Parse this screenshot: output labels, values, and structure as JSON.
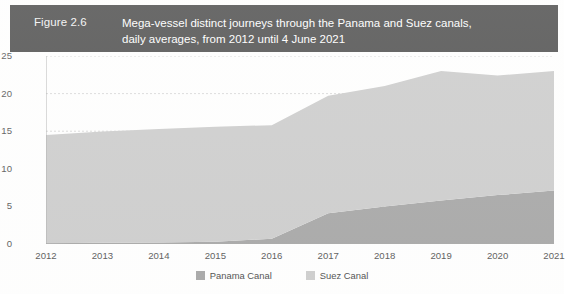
{
  "figure": {
    "number_label": "Figure 2.6",
    "title_line1": "Mega-vessel distinct journeys through the Panama and Suez canals,",
    "title_line2": "daily averages, from 2012 until 4 June 2021",
    "header_bg": "#3a3a3a",
    "header_text_color": "#ffffff"
  },
  "axes": {
    "y_title": "Daily average of distinct journeys",
    "y_ticks": [
      "0",
      "5",
      "10",
      "15",
      "20",
      "25"
    ],
    "x_ticks": [
      "2012",
      "2013",
      "2014",
      "2015",
      "2016",
      "2017",
      "2018",
      "2019",
      "2020",
      "2021"
    ]
  },
  "legend": {
    "items": [
      {
        "label": "Panama Canal",
        "color": "#9a9a9a"
      },
      {
        "label": "Suez Canal",
        "color": "#c6c6c6"
      }
    ]
  },
  "chart_data": {
    "type": "area",
    "stacked": true,
    "title": "Mega-vessel distinct journeys through the Panama and Suez canals, daily averages, from 2012 until 4 June 2021",
    "xlabel": "",
    "ylabel": "Daily average of distinct journeys",
    "x": [
      "2012",
      "2013",
      "2014",
      "2015",
      "2016",
      "2017",
      "2018",
      "2019",
      "2020",
      "2021"
    ],
    "ylim": [
      0,
      25
    ],
    "yticks": [
      0,
      5,
      10,
      15,
      20,
      25
    ],
    "grid": true,
    "grid_style": "dotted-horizontal",
    "legend_position": "bottom-center",
    "series": [
      {
        "name": "Panama Canal",
        "color": "#9a9a9a",
        "values": [
          0.1,
          0.15,
          0.2,
          0.3,
          0.7,
          4.1,
          5.0,
          5.8,
          6.5,
          7.1
        ]
      },
      {
        "name": "Suez Canal",
        "color": "#c6c6c6",
        "values": [
          14.4,
          14.8,
          15.1,
          15.3,
          15.1,
          15.6,
          16.0,
          17.2,
          15.9,
          15.9
        ]
      }
    ],
    "totals": [
      14.5,
      14.95,
      15.3,
      15.6,
      15.8,
      19.7,
      21.0,
      23.0,
      22.4,
      23.0
    ]
  }
}
